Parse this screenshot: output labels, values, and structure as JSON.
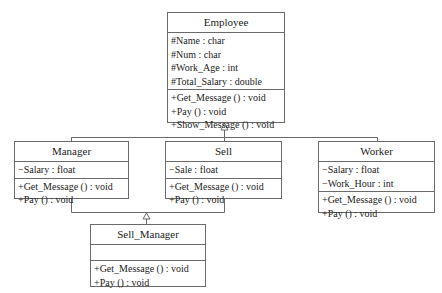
{
  "diagram": {
    "type": "uml-class-diagram",
    "classes": {
      "employee": {
        "name": "Employee",
        "attributes": [
          "#Name : char",
          "#Num : char",
          "#Work_Age : int",
          "#Total_Salary : double"
        ],
        "methods": [
          "+Get_Message () : void",
          "+Pay () : void",
          "+Show_Message () : void"
        ]
      },
      "manager": {
        "name": "Manager",
        "attributes": [
          "−Salary : float"
        ],
        "methods": [
          "+Get_Message () : void",
          "+Pay () : void"
        ]
      },
      "sell": {
        "name": "Sell",
        "attributes": [
          "−Sale : float"
        ],
        "methods": [
          "+Get_Message () : void",
          "+Pay () : void"
        ]
      },
      "worker": {
        "name": "Worker",
        "attributes": [
          "−Salary : float",
          "−Work_Hour : int"
        ],
        "methods": [
          "+Get_Message () : void",
          "+Pay () : void"
        ]
      },
      "sell_manager": {
        "name": "Sell_Manager",
        "attributes": [],
        "methods": [
          "+Get_Message () : void",
          "+Pay () : void"
        ]
      }
    },
    "relationships": [
      {
        "type": "generalization",
        "from": "Manager",
        "to": "Employee"
      },
      {
        "type": "generalization",
        "from": "Sell",
        "to": "Employee"
      },
      {
        "type": "generalization",
        "from": "Worker",
        "to": "Employee"
      },
      {
        "type": "generalization",
        "from": "Sell_Manager",
        "to": "Manager"
      },
      {
        "type": "generalization",
        "from": "Sell_Manager",
        "to": "Sell"
      }
    ],
    "colors": {
      "line": "#6a6a6a",
      "text": "#222222",
      "background": "#ffffff"
    }
  }
}
